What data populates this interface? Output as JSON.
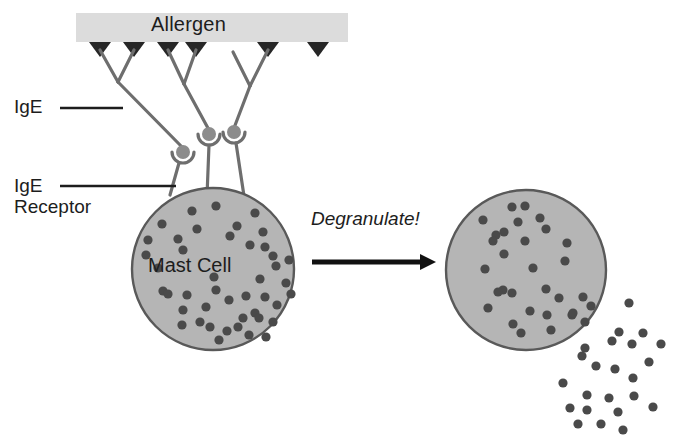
{
  "diagram": {
    "title_text": "Allergen",
    "labels": {
      "allergen": "Allergen",
      "ige": "IgE",
      "ige_receptor": "IgE\nReceptor",
      "degranulate": "Degranulate!",
      "mast_cell": "Mast Cell"
    },
    "colors": {
      "background": "#ffffff",
      "allergen_bar": "#dcdcdc",
      "allergen_triangle": "#262626",
      "antibody_stroke": "#6e6e6e",
      "receptor_fill": "#8c8c8c",
      "cell_fill": "#b5b5b5",
      "cell_stroke": "#595959",
      "granule": "#4a4a4a",
      "arrow": "#111111",
      "text": "#1d1d1d"
    },
    "allergen_bar": {
      "x": 76,
      "y": 13,
      "width": 272,
      "height": 29
    },
    "allergen_triangles": [
      {
        "x": 100,
        "y": 42,
        "w": 22,
        "h": 15,
        "bound": true
      },
      {
        "x": 134,
        "y": 42,
        "w": 22,
        "h": 15,
        "bound": true
      },
      {
        "x": 168,
        "y": 42,
        "w": 22,
        "h": 15,
        "bound": true
      },
      {
        "x": 196,
        "y": 42,
        "w": 22,
        "h": 15,
        "bound": true
      },
      {
        "x": 268,
        "y": 42,
        "w": 22,
        "h": 15,
        "bound": true
      },
      {
        "x": 318,
        "y": 42,
        "w": 22,
        "h": 15,
        "bound": false
      }
    ],
    "antibodies": [
      {
        "name": "ige-antibody-1",
        "left_tip": [
          100,
          50
        ],
        "right_tip": [
          134,
          50
        ],
        "hinge": [
          118,
          82
        ],
        "foot": [
          183,
          148
        ],
        "receptor": [
          183,
          152
        ]
      },
      {
        "name": "ige-antibody-2",
        "left_tip": [
          168,
          50
        ],
        "right_tip": [
          196,
          50
        ],
        "hinge": [
          184,
          84
        ],
        "foot": [
          209,
          130
        ],
        "receptor": [
          209,
          134
        ]
      },
      {
        "name": "ige-antibody-3",
        "left_tip": [
          233,
          52
        ],
        "right_tip": [
          268,
          50
        ],
        "hinge": [
          250,
          86
        ],
        "foot": [
          234,
          128
        ],
        "receptor": [
          234,
          132
        ]
      }
    ],
    "receptor_radius": 7,
    "mast_cells": [
      {
        "name": "mast-cell-activated",
        "cx": 213,
        "cy": 269,
        "r": 81,
        "granule_count": 44
      },
      {
        "name": "mast-cell-degranulating",
        "cx": 526,
        "cy": 270,
        "r": 80,
        "granule_count": 29
      }
    ],
    "granule_radius": 4.6,
    "cell_granules_left": [
      [
        192,
        211
      ],
      [
        216,
        206
      ],
      [
        255,
        213
      ],
      [
        162,
        224
      ],
      [
        197,
        229
      ],
      [
        237,
        226
      ],
      [
        230,
        236
      ],
      [
        263,
        232
      ],
      [
        148,
        240
      ],
      [
        178,
        239
      ],
      [
        183,
        250
      ],
      [
        250,
        245
      ],
      [
        265,
        247
      ],
      [
        146,
        255
      ],
      [
        273,
        256
      ],
      [
        276,
        266
      ],
      [
        158,
        268
      ],
      [
        289,
        260
      ],
      [
        214,
        277
      ],
      [
        260,
        279
      ],
      [
        286,
        283
      ],
      [
        163,
        291
      ],
      [
        168,
        294
      ],
      [
        187,
        295
      ],
      [
        216,
        290
      ],
      [
        229,
        300
      ],
      [
        246,
        296
      ],
      [
        265,
        297
      ],
      [
        206,
        307
      ],
      [
        255,
        313
      ],
      [
        277,
        305
      ],
      [
        291,
        294
      ],
      [
        243,
        318
      ],
      [
        259,
        318
      ],
      [
        273,
        322
      ],
      [
        238,
        327
      ],
      [
        183,
        310
      ],
      [
        200,
        322
      ],
      [
        210,
        327
      ],
      [
        227,
        331
      ],
      [
        182,
        325
      ],
      [
        219,
        340
      ],
      [
        249,
        335
      ],
      [
        266,
        337
      ]
    ],
    "cell_granules_right": [
      [
        512,
        207
      ],
      [
        525,
        206
      ],
      [
        540,
        218
      ],
      [
        483,
        220
      ],
      [
        496,
        235
      ],
      [
        504,
        232
      ],
      [
        518,
        222
      ],
      [
        493,
        241
      ],
      [
        525,
        241
      ],
      [
        546,
        229
      ],
      [
        567,
        243
      ],
      [
        504,
        254
      ],
      [
        565,
        261
      ],
      [
        533,
        268
      ],
      [
        485,
        269
      ],
      [
        503,
        290
      ],
      [
        498,
        292
      ],
      [
        512,
        293
      ],
      [
        546,
        289
      ],
      [
        559,
        298
      ],
      [
        583,
        297
      ],
      [
        572,
        315
      ],
      [
        488,
        308
      ],
      [
        530,
        311
      ],
      [
        547,
        315
      ],
      [
        585,
        322
      ],
      [
        513,
        324
      ],
      [
        551,
        330
      ],
      [
        521,
        333
      ]
    ],
    "released_granules": [
      [
        573,
        313
      ],
      [
        591,
        306
      ],
      [
        629,
        303
      ],
      [
        619,
        332
      ],
      [
        643,
        333
      ],
      [
        585,
        348
      ],
      [
        632,
        344
      ],
      [
        612,
        341
      ],
      [
        661,
        344
      ],
      [
        582,
        356
      ],
      [
        596,
        366
      ],
      [
        615,
        369
      ],
      [
        649,
        362
      ],
      [
        633,
        378
      ],
      [
        563,
        383
      ],
      [
        587,
        395
      ],
      [
        609,
        398
      ],
      [
        634,
        396
      ],
      [
        570,
        408
      ],
      [
        587,
        410
      ],
      [
        618,
        412
      ],
      [
        601,
        424
      ],
      [
        653,
        407
      ],
      [
        623,
        430
      ],
      [
        578,
        424
      ]
    ],
    "leader_lines": [
      {
        "name": "ige-leader-line",
        "x1": 60,
        "y1": 108,
        "x2": 123,
        "y2": 108
      },
      {
        "name": "ige-receptor-leader-line",
        "x1": 60,
        "y1": 186,
        "x2": 176,
        "y2": 186
      }
    ],
    "arrow": {
      "x1": 312,
      "y1": 262,
      "x2": 432,
      "y2": 262,
      "head": 14
    },
    "canvas": {
      "width": 693,
      "height": 441
    }
  }
}
